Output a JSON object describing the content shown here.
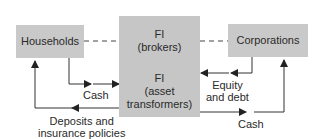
{
  "diagram": {
    "nodes": {
      "households": "Households",
      "corporations": "Corporations",
      "fi_brokers_line1": "FI",
      "fi_brokers_line2": "(brokers)",
      "fi_asset_line1": "FI",
      "fi_asset_line2": "(asset",
      "fi_asset_line3": "transformers)"
    },
    "flows": {
      "cash_left": "Cash",
      "equity_line1": "Equity",
      "equity_line2": "and debt",
      "deposits_line1": "Deposits and",
      "deposits_line2": "insurance policies",
      "cash_right": "Cash"
    },
    "colors": {
      "box_fill": "#c9c9c9",
      "line": "#333333"
    }
  }
}
